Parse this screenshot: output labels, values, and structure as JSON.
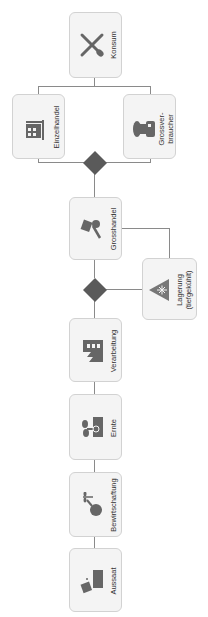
{
  "diagram": {
    "orientation": "rotated -90deg (flow bottom to top)",
    "colors": {
      "box_fill": "#f4f4f4",
      "box_border": "#d2d2d2",
      "icon": "#666666",
      "gateway": "#5a5a5a",
      "connector": "#8a8a8a"
    },
    "nodes": [
      {
        "id": "aussaat",
        "label": "Aussaat",
        "icon": "seed-planting-icon"
      },
      {
        "id": "bewirtschaftung",
        "label": "Bewirtschaftung",
        "icon": "watering-can-icon"
      },
      {
        "id": "ernte",
        "label": "Ernte",
        "icon": "sprout-icon"
      },
      {
        "id": "verarbeitung",
        "label": "Verarbeitung",
        "icon": "factory-icon"
      },
      {
        "id": "grosshandel",
        "label": "Grosshandel",
        "icon": "hand-truck-icon"
      },
      {
        "id": "lagerung",
        "label_line1": "Lagerung",
        "label_line2": "(tiefgekühlt)",
        "icon": "snowflake-triangle-icon"
      },
      {
        "id": "einzelhandel",
        "label": "Einzelhandel",
        "icon": "store-shelf-icon"
      },
      {
        "id": "grossverbraucher",
        "label_line1": "Grossver-",
        "label_line2": "braucher",
        "icon": "chef-icon"
      },
      {
        "id": "konsum",
        "label": "Konsum",
        "icon": "fork-knife-icon"
      }
    ]
  }
}
